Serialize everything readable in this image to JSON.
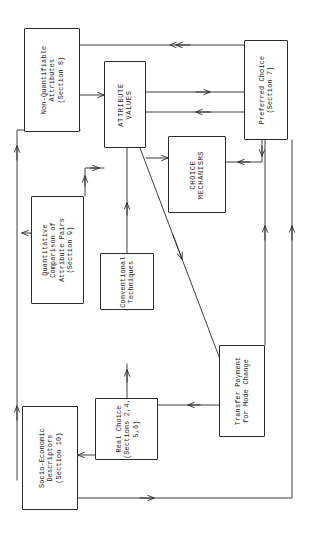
{
  "diagram": {
    "orientation": "rotated-90",
    "line_color": "#2b2b2b",
    "background": "#ffffff",
    "nodes": [
      {
        "id": "non-quantifiable-attributes",
        "label": "Non-Quantifiable\nAttributes\n(Section 8)",
        "style": "mixed-case"
      },
      {
        "id": "quantitative-comparison",
        "label": "Quantitative\nComparison of\nAttribute Pairs\n(Section 9)",
        "style": "mixed-case"
      },
      {
        "id": "socio-economic-descriptors",
        "label": "Socio-Economic\nDescriptors\n(Section 10)",
        "style": "mixed-case"
      },
      {
        "id": "attribute-values",
        "label": "ATTRIBUTE\nVALUES",
        "style": "caps"
      },
      {
        "id": "choice-mechanisms",
        "label": "CHOICE\nMECHANISMS",
        "style": "caps"
      },
      {
        "id": "preferred-choice",
        "label": "Preferred Choice\n(Section 7)",
        "style": "mixed-case"
      },
      {
        "id": "conventional-techniques",
        "label": "Conventional\nTechniques",
        "style": "mixed-case"
      },
      {
        "id": "real-choice",
        "label": "Real Choice\n(Sections 2,4,\n5,6)",
        "style": "mixed-case"
      },
      {
        "id": "transfer-payment",
        "label": "Transfer Payment\nfor Mode Change",
        "style": "mixed-case"
      }
    ],
    "edges": [
      {
        "from": "preferred-choice",
        "to": "non-quantifiable-attributes"
      },
      {
        "from": "non-quantifiable-attributes",
        "to": "attribute-values"
      },
      {
        "from": "attribute-values",
        "to": "preferred-choice"
      },
      {
        "from": "preferred-choice",
        "to": "attribute-values"
      },
      {
        "from": "preferred-choice",
        "to": "choice-mechanisms"
      },
      {
        "from": "attribute-values",
        "to": "choice-mechanisms"
      },
      {
        "from": "quantitative-comparison",
        "to": "attribute-values"
      },
      {
        "from": "socio-economic-descriptors",
        "to": "quantitative-comparison"
      },
      {
        "from": "socio-economic-descriptors",
        "to": "non-quantifiable-attributes"
      },
      {
        "from": "conventional-techniques",
        "to": "attribute-values"
      },
      {
        "from": "real-choice",
        "to": "conventional-techniques"
      },
      {
        "from": "real-choice",
        "to": "socio-economic-descriptors"
      },
      {
        "from": "transfer-payment",
        "to": "real-choice"
      },
      {
        "from": "attribute-values",
        "to": "transfer-payment"
      },
      {
        "from": "transfer-payment",
        "to": "preferred-choice"
      },
      {
        "from": "socio-economic-descriptors",
        "to": "preferred-choice"
      }
    ]
  }
}
